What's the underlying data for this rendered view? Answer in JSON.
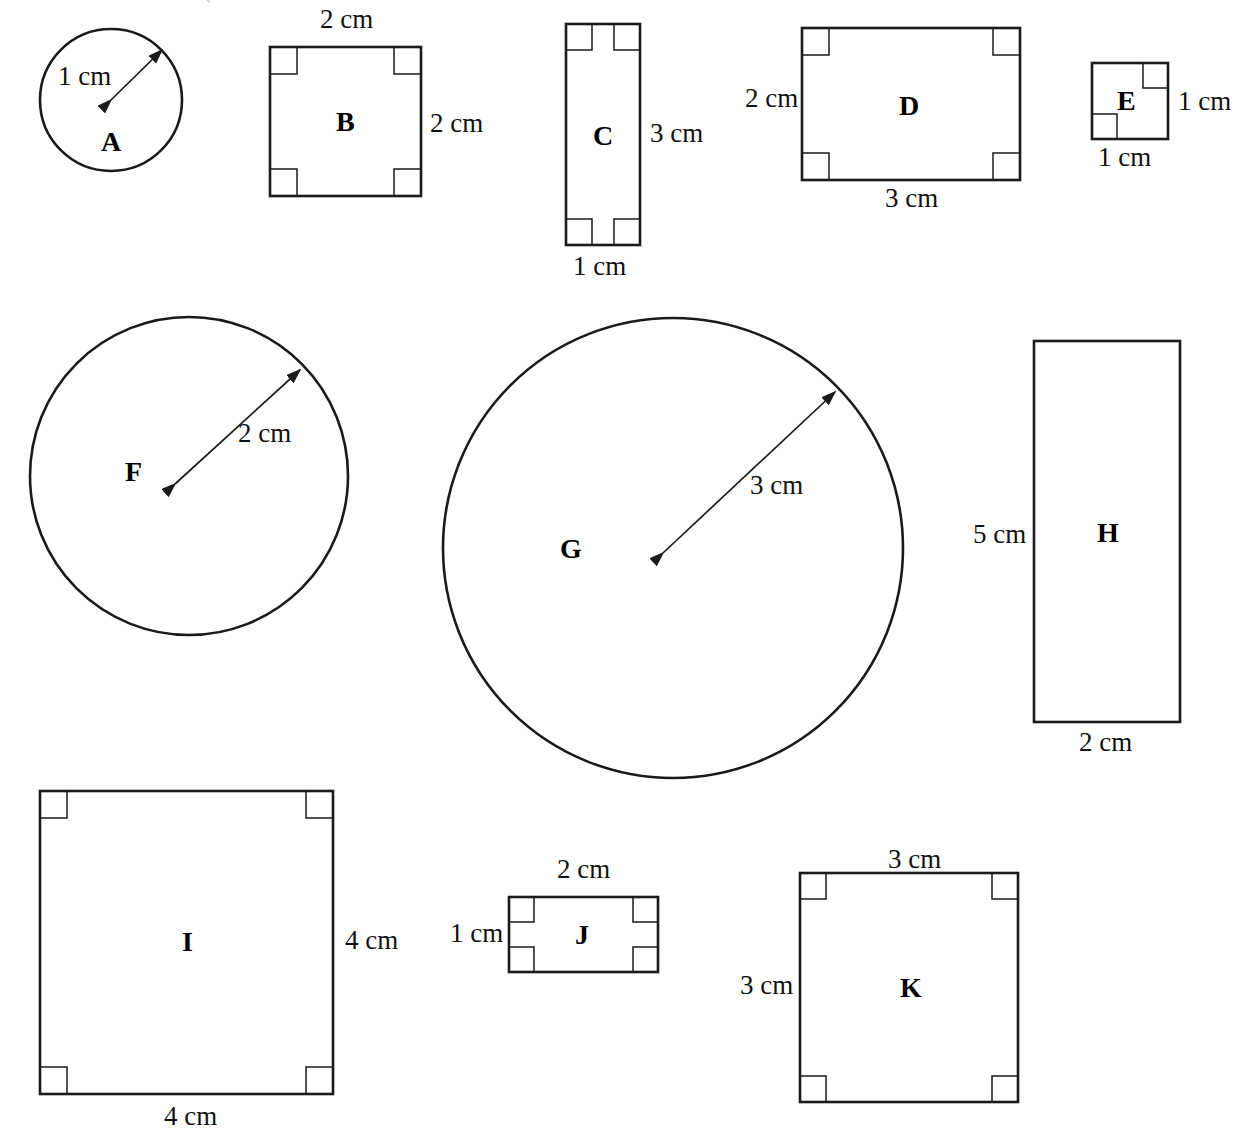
{
  "worksheet": {
    "title": "Shapes A-K with dimension labels",
    "background_color": "#ffffff",
    "stroke_color": "#1a1a1a",
    "top_artifact": "`"
  },
  "shapes": [
    {
      "letter": "A",
      "kind": "circle",
      "radius_label": "1 cm",
      "geometry": {
        "cx": 111,
        "cy": 100,
        "r": 71
      },
      "letter_pos": {
        "x": 101,
        "y": 128
      },
      "radius_label_pos": {
        "x": 58,
        "y": 63
      },
      "radius_arrow": {
        "x1": 111,
        "y1": 100,
        "x2": 162,
        "y2": 50
      }
    },
    {
      "letter": "B",
      "kind": "square",
      "top_label": "2 cm",
      "right_label": "2 cm",
      "geometry": {
        "x": 270,
        "y": 47,
        "w": 151,
        "h": 149
      },
      "corner_marks": [
        "tl",
        "tr",
        "bl",
        "br"
      ],
      "letter_pos": {
        "x": 336,
        "y": 108
      },
      "top_label_pos": {
        "x": 320,
        "y": 6
      },
      "right_label_pos": {
        "x": 430,
        "y": 110
      }
    },
    {
      "letter": "C",
      "kind": "rectangle",
      "right_label": "3 cm",
      "bottom_label": "1 cm",
      "geometry": {
        "x": 566,
        "y": 24,
        "w": 74,
        "h": 221
      },
      "corner_marks": [
        "tl",
        "tr",
        "bl",
        "br"
      ],
      "letter_pos": {
        "x": 593,
        "y": 122
      },
      "right_label_pos": {
        "x": 650,
        "y": 120
      },
      "bottom_label_pos": {
        "x": 573,
        "y": 253
      }
    },
    {
      "letter": "D",
      "kind": "rectangle",
      "left_label": "2 cm",
      "bottom_label": "3 cm",
      "geometry": {
        "x": 802,
        "y": 28,
        "w": 218,
        "h": 152
      },
      "corner_marks": [
        "tl",
        "tr",
        "bl",
        "br"
      ],
      "letter_pos": {
        "x": 899,
        "y": 92
      },
      "left_label_pos": {
        "x": 745,
        "y": 85
      },
      "bottom_label_pos": {
        "x": 885,
        "y": 185
      }
    },
    {
      "letter": "E",
      "kind": "square",
      "right_label": "1 cm",
      "bottom_label": "1 cm",
      "geometry": {
        "x": 1092,
        "y": 63,
        "w": 76,
        "h": 76
      },
      "corner_marks": [
        "tr",
        "bl"
      ],
      "letter_pos": {
        "x": 1117,
        "y": 87
      },
      "right_label_pos": {
        "x": 1178,
        "y": 88
      },
      "bottom_label_pos": {
        "x": 1098,
        "y": 144
      }
    },
    {
      "letter": "F",
      "kind": "circle",
      "radius_label": "2 cm",
      "geometry": {
        "cx": 189,
        "cy": 476,
        "r": 159
      },
      "letter_pos": {
        "x": 125,
        "y": 458
      },
      "radius_label_pos": {
        "x": 238,
        "y": 420
      },
      "radius_arrow": {
        "x1": 175,
        "y1": 484,
        "x2": 300,
        "y2": 370
      }
    },
    {
      "letter": "G",
      "kind": "circle",
      "radius_label": "3 cm",
      "geometry": {
        "cx": 673,
        "cy": 548,
        "r": 230
      },
      "letter_pos": {
        "x": 560,
        "y": 535
      },
      "radius_label_pos": {
        "x": 750,
        "y": 472
      },
      "radius_arrow": {
        "x1": 663,
        "y1": 553,
        "x2": 835,
        "y2": 392
      }
    },
    {
      "letter": "H",
      "kind": "rectangle",
      "left_label": "5 cm",
      "bottom_label": "2 cm",
      "geometry": {
        "x": 1034,
        "y": 341,
        "w": 146,
        "h": 381
      },
      "corner_marks": [],
      "letter_pos": {
        "x": 1097,
        "y": 519
      },
      "left_label_pos": {
        "x": 973,
        "y": 521
      },
      "bottom_label_pos": {
        "x": 1079,
        "y": 729
      }
    },
    {
      "letter": "I",
      "kind": "square",
      "right_label": "4 cm",
      "bottom_label": "4 cm",
      "geometry": {
        "x": 40,
        "y": 791,
        "w": 293,
        "h": 303
      },
      "corner_marks": [
        "tl",
        "tr",
        "bl",
        "br"
      ],
      "letter_pos": {
        "x": 182,
        "y": 928
      },
      "right_label_pos": {
        "x": 345,
        "y": 927
      },
      "bottom_label_pos": {
        "x": 164,
        "y": 1103
      }
    },
    {
      "letter": "J",
      "kind": "rectangle",
      "top_label": "2 cm",
      "left_label": "1 cm",
      "geometry": {
        "x": 509,
        "y": 897,
        "w": 149,
        "h": 75
      },
      "corner_marks": [
        "tl",
        "tr",
        "bl",
        "br"
      ],
      "letter_pos": {
        "x": 575,
        "y": 921
      },
      "top_label_pos": {
        "x": 557,
        "y": 856
      },
      "left_label_pos": {
        "x": 450,
        "y": 920
      }
    },
    {
      "letter": "K",
      "kind": "square",
      "top_label": "3 cm",
      "left_label": "3 cm",
      "geometry": {
        "x": 800,
        "y": 873,
        "w": 218,
        "h": 229
      },
      "corner_marks": [
        "tl",
        "tr",
        "bl",
        "br"
      ],
      "letter_pos": {
        "x": 900,
        "y": 974
      },
      "top_label_pos": {
        "x": 888,
        "y": 846
      },
      "left_label_pos": {
        "x": 740,
        "y": 972
      }
    }
  ],
  "labels": {
    "a_radius": "1 cm",
    "b_top": "2 cm",
    "b_right": "2 cm",
    "c_right": "3 cm",
    "c_bottom": "1 cm",
    "d_left": "2 cm",
    "d_bottom": "3 cm",
    "e_right": "1 cm",
    "e_bottom": "1 cm",
    "f_radius": "2 cm",
    "g_radius": "3 cm",
    "h_left": "5 cm",
    "h_bottom": "2 cm",
    "i_right": "4 cm",
    "i_bottom": "4 cm",
    "j_top": "2 cm",
    "j_left": "1 cm",
    "k_top": "3 cm",
    "k_left": "3 cm"
  },
  "letters": {
    "a": "A",
    "b": "B",
    "c": "C",
    "d": "D",
    "e": "E",
    "f": "F",
    "g": "G",
    "h": "H",
    "i": "I",
    "j": "J",
    "k": "K"
  }
}
